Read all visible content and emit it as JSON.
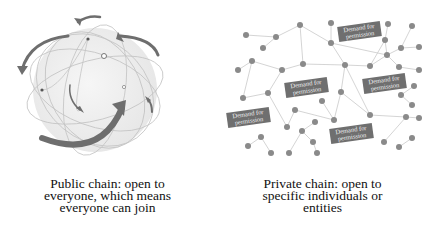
{
  "public_chain": {
    "caption_lines": [
      "Public chain: open to",
      "everyone, which means",
      "everyone can join"
    ],
    "illustration": "globe-with-orbiting-arrows",
    "colors": {
      "globe": "#eeeeee",
      "orbit": "#c4c4c4",
      "arrow": "#6e6e6e",
      "node": "#555555"
    }
  },
  "private_chain": {
    "caption_lines": [
      "Private chain: open to",
      "specific individuals or",
      "entities"
    ],
    "illustration": "network-nodes",
    "permission_labels": [
      {
        "line1": "Demand for",
        "line2": "permission"
      },
      {
        "line1": "Demand for",
        "line2": "permission"
      },
      {
        "line1": "Demand for",
        "line2": "permission"
      },
      {
        "line1": "Demand for",
        "line2": "permission"
      },
      {
        "line1": "Demand for",
        "line2": "permission"
      }
    ],
    "colors": {
      "node": "#8a8a8a",
      "edge": "#c9c9c9",
      "label_bg": "#6f6f6f",
      "label_text": "#f0f0f0"
    }
  }
}
